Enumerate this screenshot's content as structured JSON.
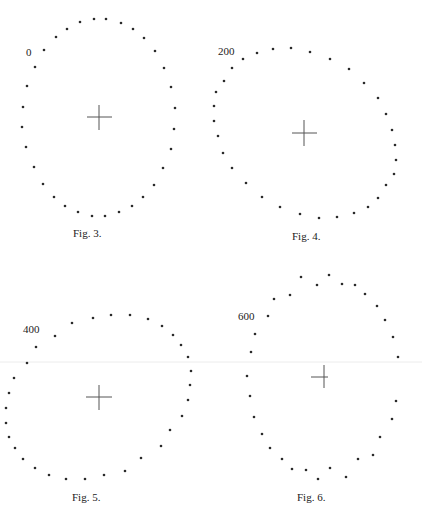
{
  "plate": {
    "rule_y": 362,
    "figures": [
      {
        "id": "fig3",
        "label": "0",
        "label_pos": [
          26,
          56
        ],
        "caption": "Fig. 3.",
        "caption_pos": [
          73,
          237
        ],
        "cross": {
          "cx": 99,
          "cy": 117,
          "h": [
            87,
            112
          ],
          "v": [
            105,
            130
          ]
        },
        "dots": [
          [
            94,
            19
          ],
          [
            106,
            19
          ],
          [
            121,
            23
          ],
          [
            133,
            29
          ],
          [
            144,
            38
          ],
          [
            155,
            51
          ],
          [
            164,
            68
          ],
          [
            171,
            87
          ],
          [
            175,
            108
          ],
          [
            174,
            129
          ],
          [
            171,
            149
          ],
          [
            163,
            168
          ],
          [
            154,
            185
          ],
          [
            143,
            197
          ],
          [
            132,
            206
          ],
          [
            119,
            212
          ],
          [
            105,
            216
          ],
          [
            92,
            216
          ],
          [
            78,
            212
          ],
          [
            65,
            206
          ],
          [
            54,
            197
          ],
          [
            43,
            184
          ],
          [
            34,
            167
          ],
          [
            26,
            147
          ],
          [
            22,
            127
          ],
          [
            23,
            107
          ],
          [
            27,
            86
          ],
          [
            35,
            67
          ],
          [
            44,
            50
          ],
          [
            56,
            37
          ],
          [
            67,
            29
          ],
          [
            80,
            22
          ]
        ]
      },
      {
        "id": "fig4",
        "label": "200",
        "label_pos": [
          218,
          55
        ],
        "caption": "Fig. 4.",
        "caption_pos": [
          292,
          240
        ],
        "cross": {
          "cx": 304,
          "cy": 133,
          "h": [
            292,
            317
          ],
          "v": [
            120,
            146
          ]
        },
        "dots": [
          [
            273,
            49
          ],
          [
            291,
            48
          ],
          [
            310,
            52
          ],
          [
            330,
            59
          ],
          [
            349,
            69
          ],
          [
            364,
            83
          ],
          [
            378,
            98
          ],
          [
            386,
            114
          ],
          [
            392,
            130
          ],
          [
            395,
            145
          ],
          [
            396,
            160
          ],
          [
            394,
            174
          ],
          [
            386,
            185
          ],
          [
            378,
            198
          ],
          [
            368,
            207
          ],
          [
            354,
            213
          ],
          [
            337,
            217
          ],
          [
            319,
            218
          ],
          [
            300,
            214
          ],
          [
            280,
            207
          ],
          [
            262,
            197
          ],
          [
            246,
            183
          ],
          [
            232,
            168
          ],
          [
            223,
            153
          ],
          [
            218,
            136
          ],
          [
            214,
            121
          ],
          [
            214,
            106
          ],
          [
            216,
            92
          ],
          [
            224,
            81
          ],
          [
            232,
            68
          ],
          [
            243,
            59
          ],
          [
            257,
            53
          ]
        ]
      },
      {
        "id": "fig5",
        "label": "400",
        "label_pos": [
          23,
          333
        ],
        "caption": "Fig. 5.",
        "caption_pos": [
          72,
          501
        ],
        "cross": {
          "cx": 99,
          "cy": 397,
          "h": [
            86,
            112
          ],
          "v": [
            385,
            410
          ]
        },
        "dots": [
          [
            93,
            318
          ],
          [
            111,
            315
          ],
          [
            130,
            315
          ],
          [
            148,
            319
          ],
          [
            162,
            326
          ],
          [
            173,
            335
          ],
          [
            181,
            345
          ],
          [
            188,
            357
          ],
          [
            191,
            371
          ],
          [
            190,
            385
          ],
          [
            188,
            400
          ],
          [
            182,
            416
          ],
          [
            170,
            430
          ],
          [
            161,
            446
          ],
          [
            141,
            458
          ],
          [
            125,
            471
          ],
          [
            104,
            475
          ],
          [
            85,
            479
          ],
          [
            66,
            479
          ],
          [
            49,
            475
          ],
          [
            35,
            468
          ],
          [
            23,
            459
          ],
          [
            15,
            448
          ],
          [
            9,
            437
          ],
          [
            6,
            423
          ],
          [
            6,
            408
          ],
          [
            9,
            393
          ],
          [
            14,
            378
          ],
          [
            27,
            363
          ],
          [
            36,
            347
          ],
          [
            55,
            336
          ],
          [
            72,
            323
          ]
        ]
      },
      {
        "id": "fig6",
        "label": "600",
        "label_pos": [
          238,
          320
        ],
        "caption": "Fig. 6.",
        "caption_pos": [
          297,
          501
        ],
        "cross": {
          "cx": 324,
          "cy": 377,
          "h": [
            311,
            328
          ],
          "v": [
            365,
            388
          ]
        },
        "dots": [
          [
            301,
            277
          ],
          [
            329,
            275
          ],
          [
            317,
            285
          ],
          [
            342,
            284
          ],
          [
            355,
            285
          ],
          [
            365,
            294
          ],
          [
            377,
            306
          ],
          [
            385,
            320
          ],
          [
            393,
            337
          ],
          [
            398,
            357
          ],
          [
            396,
            401
          ],
          [
            392,
            419
          ],
          [
            380,
            437
          ],
          [
            373,
            455
          ],
          [
            358,
            459
          ],
          [
            346,
            477
          ],
          [
            330,
            468
          ],
          [
            318,
            479
          ],
          [
            306,
            470
          ],
          [
            292,
            469
          ],
          [
            282,
            459
          ],
          [
            270,
            448
          ],
          [
            262,
            434
          ],
          [
            254,
            417
          ],
          [
            250,
            396
          ],
          [
            247,
            376
          ],
          [
            251,
            352
          ],
          [
            255,
            334
          ],
          [
            268,
            316
          ],
          [
            274,
            299
          ],
          [
            290,
            295
          ]
        ]
      }
    ]
  }
}
